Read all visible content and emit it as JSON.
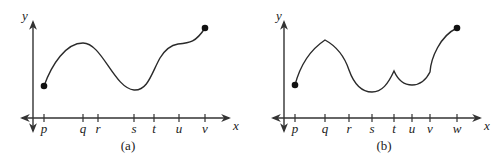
{
  "panels": [
    {
      "id": "a",
      "caption": "(a)",
      "y_axis_label": "y",
      "x_axis_label": "x",
      "tick_labels": [
        "p",
        "q",
        "r",
        "s",
        "t",
        "u",
        "v"
      ],
      "description": "Continuous smooth curve from a closed dot at p, rising to a maximum at q, falling to a minimum at s, rising to a level plateau near u, then rising to a closed dot at v."
    },
    {
      "id": "b",
      "caption": "(b)",
      "y_axis_label": "y",
      "x_axis_label": "x",
      "tick_labels": [
        "p",
        "q",
        "r",
        "s",
        "t",
        "u",
        "v",
        "w"
      ],
      "description": "Continuous curve from a closed dot at p, rising to a corner maximum at q, falling to a minimum near s, a cusp (sharp local maximum) at t, a local minimum near u, a kink at v, then rising to a closed dot at w."
    }
  ]
}
